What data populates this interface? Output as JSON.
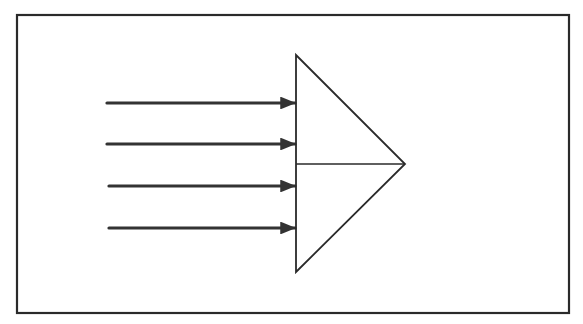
{
  "diagram": {
    "colors": {
      "background": "#ffffff",
      "stroke": "#2a2a2a",
      "arrow": "#333333"
    },
    "frame": {
      "x": 17,
      "y": 15,
      "width": 552,
      "height": 298
    },
    "triangle": {
      "top": [
        296,
        55
      ],
      "bottom": [
        296,
        272
      ],
      "apex": [
        405,
        164
      ],
      "divider_y": 164
    },
    "arrows": [
      {
        "x1": 107,
        "x2": 296,
        "y": 103
      },
      {
        "x1": 107,
        "x2": 296,
        "y": 144
      },
      {
        "x1": 109,
        "x2": 296,
        "y": 186
      },
      {
        "x1": 109,
        "x2": 296,
        "y": 228
      }
    ]
  }
}
